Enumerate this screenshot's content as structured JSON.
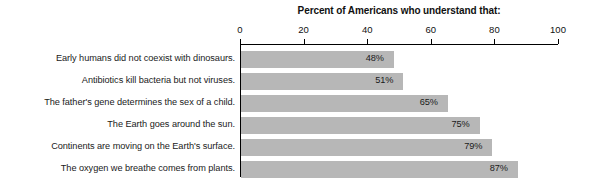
{
  "chart_data": {
    "type": "bar",
    "orientation": "horizontal",
    "title": "Percent of Americans who understand that:",
    "xlabel": "",
    "ylabel": "",
    "xlim": [
      0,
      100
    ],
    "xticks": [
      "0",
      "20",
      "40",
      "60",
      "80",
      "100"
    ],
    "grid": false,
    "legend": null,
    "bar_color": "#b7b7b7",
    "categories": [
      "Early humans did not coexist with dinosaurs.",
      "Antibiotics kill bacteria but not viruses.",
      "The father's gene determines the sex of a child.",
      "The Earth goes around the sun.",
      "Continents are moving on the Earth's surface.",
      "The oxygen we breathe comes from plants."
    ],
    "values": [
      48,
      51,
      65,
      75,
      79,
      87
    ],
    "data_labels": [
      "48%",
      "51%",
      "65%",
      "75%",
      "79%",
      "87%"
    ]
  }
}
